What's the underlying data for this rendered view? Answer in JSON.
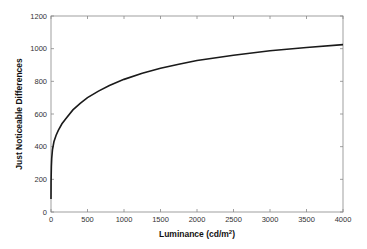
{
  "chart_data": {
    "type": "line",
    "title": "",
    "xlabel": "Luminance (cd/m",
    "xlabel_superscript": "2",
    "xlabel_suffix": ")",
    "ylabel": "Just Noticeable Differences",
    "xlim": [
      0,
      4000
    ],
    "ylim": [
      0,
      1200
    ],
    "xticks": [
      0,
      500,
      1000,
      1500,
      2000,
      2500,
      3000,
      3500,
      4000
    ],
    "yticks": [
      0,
      200,
      400,
      600,
      800,
      1000,
      1200
    ],
    "grid": false,
    "legend": null,
    "series": [
      {
        "name": "JND curve",
        "color": "#1a1a1a",
        "x": [
          0.05,
          1,
          5,
          10,
          20,
          40,
          70,
          100,
          150,
          200,
          300,
          400,
          500,
          650,
          800,
          1000,
          1250,
          1500,
          1750,
          2000,
          2500,
          3000,
          3500,
          4000
        ],
        "y": [
          80,
          180,
          280,
          330,
          380,
          430,
          470,
          500,
          540,
          570,
          625,
          665,
          700,
          740,
          775,
          812,
          850,
          880,
          905,
          928,
          960,
          987,
          1007,
          1025
        ]
      }
    ]
  }
}
